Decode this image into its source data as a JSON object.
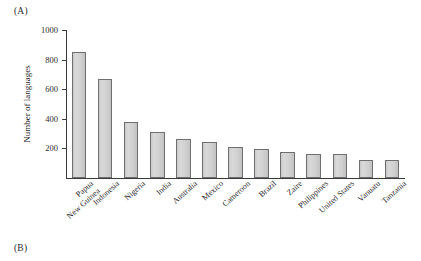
{
  "figure": {
    "panel_a_label": "(A)",
    "panel_b_label": "(B)"
  },
  "chart_data": {
    "type": "bar",
    "title": "",
    "xlabel": "",
    "ylabel": "Number of languages",
    "ylim": [
      0,
      1000
    ],
    "yticks": [
      200,
      400,
      600,
      800,
      1000
    ],
    "grid": false,
    "legend": null,
    "bar_color": "#d2d2d2",
    "bar_edge_color": "#6f6f6f",
    "categories": [
      "Papua\nNew Guinea",
      "Indonesia",
      "Nigeria",
      "India",
      "Australia",
      "Mexico",
      "Cameroon",
      "Brazil",
      "Zaire",
      "Philippines",
      "United States",
      "Vanuatu",
      "Tanzania"
    ],
    "values": [
      850,
      670,
      380,
      310,
      265,
      240,
      210,
      195,
      175,
      165,
      160,
      125,
      120
    ]
  }
}
